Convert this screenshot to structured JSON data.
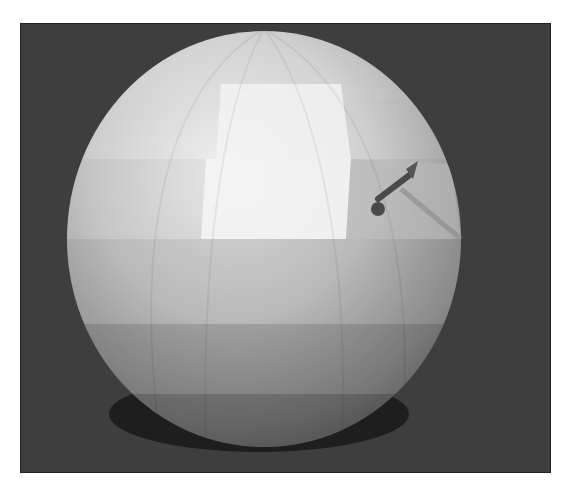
{
  "scene": {
    "subject": "low-poly shaded sphere with cursor",
    "background_color": "#3e3e3e",
    "sphere": {
      "center": [
        263,
        238
      ],
      "radius_x": 197,
      "radius_y": 210,
      "shadow_color": "#1e1e1e"
    },
    "cursor": {
      "name": "pointer-arrow",
      "color": "#4a4a4a"
    }
  }
}
